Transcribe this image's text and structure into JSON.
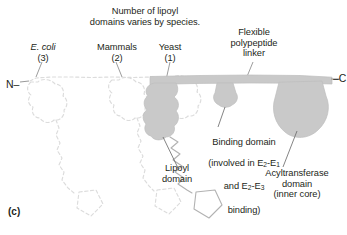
{
  "figure": {
    "panel_letter": "(c)",
    "caption_title": "Number of lipoyl\ndomains varies by species.",
    "termini": {
      "n_terminus": "N–",
      "c_terminus": "–C"
    },
    "species_labels": [
      {
        "name": "E. coli",
        "count": "(3)",
        "italic": true
      },
      {
        "name": "Mammals",
        "count": "(2)",
        "italic": false
      },
      {
        "name": "Yeast",
        "count": "(1)",
        "italic": false
      }
    ],
    "annotations": {
      "linker": "Flexible\npolypeptide\nlinker",
      "lipoyl": "Lipoyl\ndomain",
      "binding_line1": "Binding domain",
      "binding_line2": "(involved in E",
      "binding_sub1": "2",
      "binding_mid1": "-E",
      "binding_sub2": "1",
      "binding_line3a": "and E",
      "binding_sub3": "2",
      "binding_mid2": "-E",
      "binding_sub4": "3",
      "binding_line4": "binding)",
      "acyltransferase": "Acyltransferase\ndomain\n(inner core)"
    },
    "colors": {
      "protein_fill": "#c9c9c9",
      "protein_stroke": "#b4b4b4",
      "ghost_outline": "#d9d9d9",
      "solid_outline": "#b0b0b0",
      "leader_line": "#808080",
      "text": "#231f20",
      "background": "#ffffff"
    }
  }
}
